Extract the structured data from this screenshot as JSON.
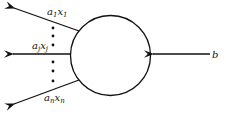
{
  "diagram": {
    "node": "circle",
    "outputs": [
      {
        "coef": "a",
        "sub": "1",
        "var": "x",
        "vsub": "1"
      },
      {
        "coef": "a",
        "sub": "j",
        "var": "x",
        "vsub": "j"
      },
      {
        "coef": "a",
        "sub": "n",
        "var": "x",
        "vsub": "n"
      }
    ],
    "input": {
      "label": "b"
    },
    "ellipsis": "vertical-dots",
    "colors": {
      "stroke": "#111111",
      "background": "#ffffff"
    }
  }
}
